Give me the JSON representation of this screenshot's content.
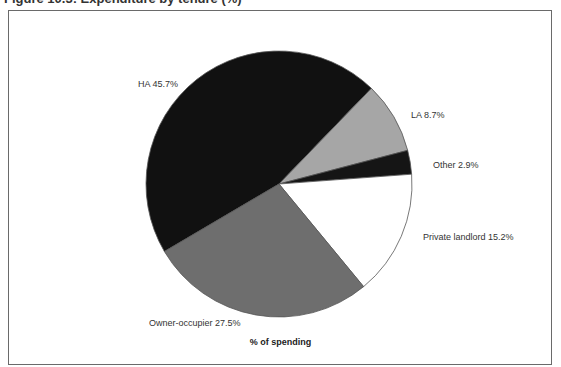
{
  "title": "Figure 10.3: Expenditure by tenure (%)",
  "chart_data": {
    "type": "pie",
    "title": "Figure 10.3: Expenditure by tenure (%)",
    "xlabel": "% of spending",
    "ylabel": "",
    "legend": "none (direct labels)",
    "categories": [
      "HA",
      "LA",
      "Other",
      "Private landlord",
      "Owner-occupier"
    ],
    "values": [
      45.7,
      8.7,
      2.9,
      15.2,
      27.5
    ],
    "labels": [
      "HA 45.7%",
      "LA 8.7%",
      "Other 2.9%",
      "Private landlord 15.2%",
      "Owner-occupier 27.5%"
    ],
    "colors": [
      "#111111",
      "#a6a6a6",
      "#151515",
      "#ffffff",
      "#6e6e6e"
    ],
    "start_angle_deg": 239.5,
    "direction": "clockwise"
  },
  "labels": {
    "ha": "HA 45.7%",
    "la": "LA 8.7%",
    "other": "Other 2.9%",
    "private": "Private landlord 15.2%",
    "owner": "Owner-occupier 27.5%"
  },
  "xlabel": "% of spending"
}
